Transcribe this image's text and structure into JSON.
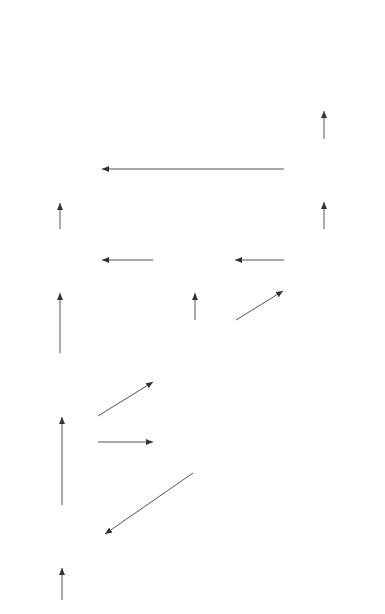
{
  "diagram": {
    "orientation": "rotated-90-ccw",
    "box_fill": "#8a8a8a",
    "line_color": "#555555",
    "nodes": [
      {
        "id": "pairwise",
        "title": [
          "Pairwise",
          "sequence",
          "methods"
        ],
        "tool": "Homol"
      },
      {
        "id": "profile1d",
        "title": [
          "1D profile",
          "searches"
        ],
        "tool": "Impala/ SAMT"
      },
      {
        "id": "domain",
        "title": [
          "Domain",
          "boundary",
          "assignment"
        ],
        "tool": "DBS/ GRATH"
      },
      {
        "id": "fast",
        "title": [
          "Fast",
          "structure",
          "comparison"
        ],
        "tool": "GRATH"
      },
      {
        "id": "auto",
        "title": [
          "Automatic",
          "homology",
          "assignment"
        ],
        "tool": "ConA"
      },
      {
        "id": "ssaph",
        "title": [
          "Structure",
          "comparison"
        ],
        "tool": "SSAP",
        "tool_sup": "H"
      },
      {
        "id": "dhs",
        "title": [
          "Homology",
          "validation"
        ],
        "tool": "DHS"
      },
      {
        "id": "cora",
        "title": [
          "3D template",
          "searches"
        ],
        "tool": "CORA"
      },
      {
        "id": "ssapt",
        "title": [
          "Structure",
          "comparison"
        ],
        "tool": "SSAP",
        "tool_sup": "T"
      },
      {
        "id": "manual",
        "title": [
          "Manual",
          "architecture",
          "assignment"
        ],
        "tool": ""
      }
    ],
    "edges": [
      {
        "from": "input",
        "to": "pairwise",
        "label": "8"
      },
      {
        "from": "pairwise",
        "to": "profile1d",
        "label": "8,6"
      },
      {
        "from": "profile1d",
        "to": "ssaph",
        "label": "6",
        "label2": "HIT"
      },
      {
        "from": "profile1d",
        "to": "fast",
        "label": "6"
      },
      {
        "from": "profile1d",
        "to": "domain",
        "label": "7"
      },
      {
        "from": "domain",
        "to": "pairwise",
        "label": "6"
      },
      {
        "from": "fast",
        "to": "auto",
        "label": "HIT"
      },
      {
        "from": "fast",
        "to": "cora",
        "label": ""
      },
      {
        "from": "cora",
        "to": "auto",
        "label": "HIT"
      },
      {
        "from": "auto",
        "to": "ssaph",
        "label": ""
      },
      {
        "from": "ssaph",
        "to": "dhs",
        "label": ""
      },
      {
        "from": "cora",
        "to": "ssapt",
        "label": ""
      },
      {
        "from": "ssapt",
        "to": "dhs",
        "label": "HIT"
      },
      {
        "from": "ssapt",
        "to": "manual",
        "label": ""
      }
    ]
  }
}
